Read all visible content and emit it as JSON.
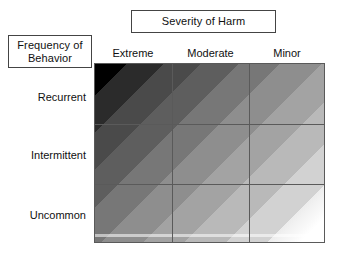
{
  "headers": {
    "column_group_label": "Severity of Harm",
    "row_group_label": "Frequency of\nBehavior"
  },
  "columns": [
    {
      "label": "Extreme"
    },
    {
      "label": "Moderate"
    },
    {
      "label": "Minor"
    }
  ],
  "rows": [
    {
      "label": "Recurrent"
    },
    {
      "label": "Intermittent"
    },
    {
      "label": "Uncommon"
    }
  ],
  "chart_data": {
    "type": "heatmap",
    "title": "",
    "xlabel": "Severity of Harm",
    "ylabel": "Frequency of Behavior",
    "categories_x": [
      "Extreme",
      "Moderate",
      "Minor"
    ],
    "categories_y": [
      "Recurrent",
      "Intermittent",
      "Uncommon"
    ],
    "legend": "none",
    "grid": true,
    "note": "Continuous diagonal grayscale ramp; darkest (black) at Recurrent/Extreme, lightest (white) at Uncommon/Minor. Cell values below are the approximate mean gray level (0 = black, 100 = white) of each cell.",
    "values": [
      [
        8,
        38,
        62
      ],
      [
        38,
        62,
        84
      ],
      [
        62,
        84,
        99
      ]
    ],
    "cell_colors": [
      [
        "#151515",
        "#616161",
        "#9e9e9e"
      ],
      [
        "#616161",
        "#9e9e9e",
        "#d6d6d6"
      ],
      [
        "#9e9e9e",
        "#d6d6d6",
        "#fcfcfc"
      ]
    ],
    "ramp_direction": "135deg (top-left to bottom-right)",
    "ramp_stops": [
      "#000000",
      "#2b2b2b",
      "#4a4a4a",
      "#5e5e5e",
      "#777777",
      "#8e8e8e",
      "#a3a3a3",
      "#b9b9b9",
      "#d2d2d2",
      "#ededed",
      "#ffffff"
    ],
    "colors": {
      "darkest": "#000000",
      "lightest": "#ffffff",
      "grid_line": "#5a5a5a",
      "box_border": "#444444",
      "text": "#101010",
      "background": "#ffffff"
    }
  }
}
